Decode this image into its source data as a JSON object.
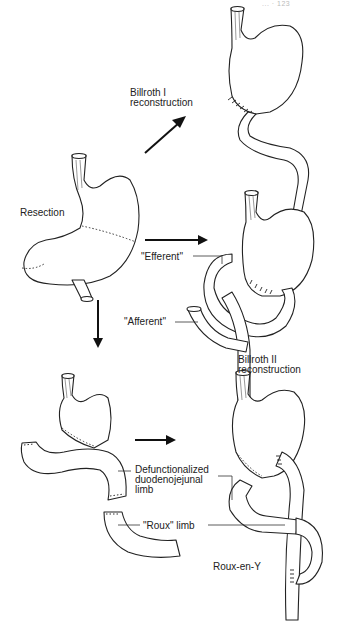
{
  "page_header": "...  ·  123",
  "labels": {
    "billroth1": "Billroth I\nreconstruction",
    "resection": "Resection",
    "efferent": "\"Efferent\"",
    "afferent": "\"Afferent\"",
    "billroth2": "Billroth II\nreconstruction",
    "defunctionalized": "Defunctionalized\nduodenojejunal\nlimb",
    "roux_limb": "\"Roux\" limb",
    "roux_en_y": "Roux-en-Y"
  },
  "colors": {
    "line": "#222222",
    "background": "#ffffff"
  }
}
